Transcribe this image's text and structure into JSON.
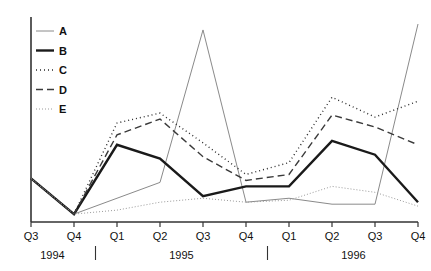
{
  "chart_data": {
    "type": "line",
    "title": "",
    "subtitle": "",
    "xlabel": "",
    "ylabel": "",
    "grid": false,
    "legend_position": "top-left",
    "x_tick_labels": [
      "Q3",
      "Q4",
      "Q1",
      "Q2",
      "Q3",
      "Q4",
      "Q1",
      "Q2",
      "Q3",
      "Q4"
    ],
    "x_group_labels": [
      "1994",
      "1995",
      "1996"
    ],
    "x_group_spans": [
      [
        0,
        1
      ],
      [
        2,
        5
      ],
      [
        6,
        9
      ]
    ],
    "x_axis_line": true,
    "y_axis_line": true,
    "y_tick_labels": [],
    "ylim": [
      0,
      100
    ],
    "series": [
      {
        "name": "A",
        "style": "thin-solid-gray",
        "color": "#8a8a8a",
        "width": 1,
        "dash": "none",
        "values": [
          22,
          4,
          12,
          20,
          97,
          10,
          12,
          9,
          9,
          100
        ]
      },
      {
        "name": "B",
        "style": "thick-solid-black",
        "color": "#1a1a1a",
        "width": 2.4,
        "dash": "none",
        "values": [
          22,
          4,
          39,
          32,
          13,
          18,
          18,
          41,
          34,
          10
        ]
      },
      {
        "name": "C",
        "style": "dotted",
        "color": "#2a2a2a",
        "width": 1.4,
        "dash": "1,3",
        "values": [
          22,
          4,
          50,
          55,
          40,
          24,
          30,
          63,
          53,
          61
        ]
      },
      {
        "name": "D",
        "style": "dashed",
        "color": "#3a3a3a",
        "width": 1.4,
        "dash": "7,4",
        "values": [
          22,
          4,
          44,
          52,
          33,
          21,
          24,
          54,
          48,
          39
        ]
      },
      {
        "name": "E",
        "style": "fine-dotted-gray",
        "color": "#9a9a9a",
        "width": 1,
        "dash": "1,2",
        "values": [
          22,
          4,
          6,
          10,
          12,
          10,
          11,
          18,
          15,
          8
        ]
      }
    ],
    "legend_entries": [
      {
        "label": "A",
        "color": "#8a8a8a",
        "dash": "none",
        "width": 1
      },
      {
        "label": "B",
        "color": "#1a1a1a",
        "dash": "none",
        "width": 2.4
      },
      {
        "label": "C",
        "color": "#2a2a2a",
        "dash": "1,3",
        "width": 1.4
      },
      {
        "label": "D",
        "color": "#3a3a3a",
        "dash": "7,4",
        "width": 1.4
      },
      {
        "label": "E",
        "color": "#9a9a9a",
        "dash": "1,2",
        "width": 1
      }
    ]
  }
}
